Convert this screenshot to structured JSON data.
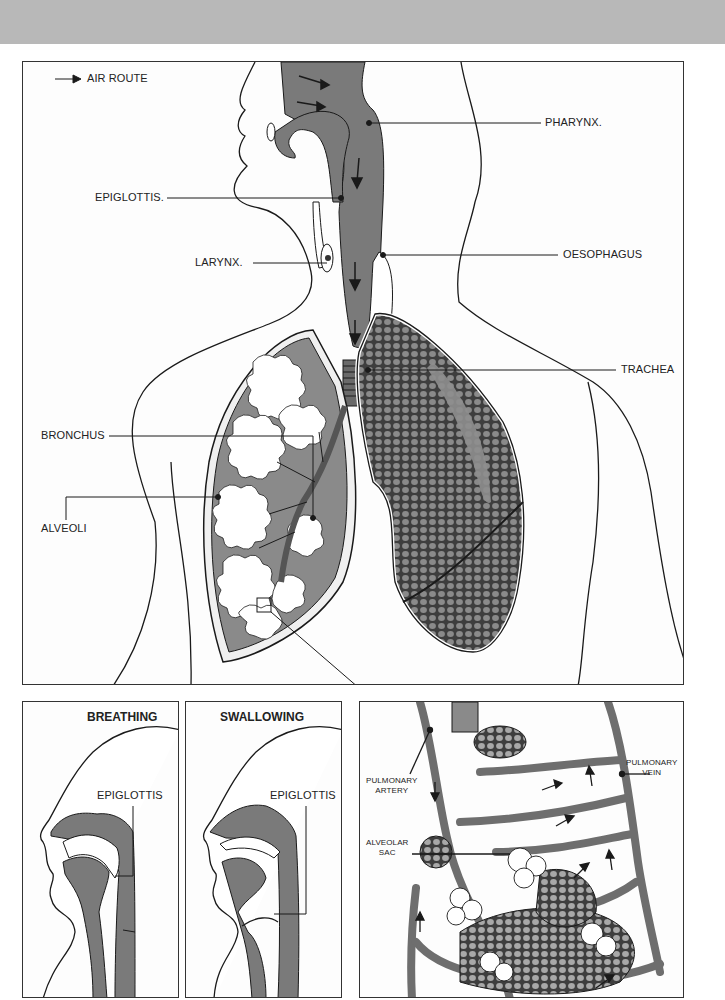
{
  "main_diagram": {
    "legend": {
      "icon": "arrow-right-icon",
      "label": "AIR ROUTE"
    },
    "labels": {
      "pharynx": "PHARYNX.",
      "epiglottis": "EPIGLOTTIS.",
      "larynx": "LARYNX.",
      "oesophagus": "OESOPHAGUS",
      "trachea": "TRACHEA",
      "bronchus": "BRONCHUS",
      "alveoli": "ALVEOLI"
    }
  },
  "breathing_panel": {
    "title": "BREATHING",
    "label": "EPIGLOTTIS"
  },
  "swallowing_panel": {
    "title": "SWALLOWING",
    "label": "EPIGLOTTIS"
  },
  "detail_panel": {
    "labels": {
      "pulmonary_artery_1": "PULMONARY",
      "pulmonary_artery_2": "ARTERY",
      "pulmonary_vein_1": "PULMONARY",
      "pulmonary_vein_2": "VEIN",
      "alveolar_sac_1": "ALVEOLAR",
      "alveolar_sac_2": "SAC"
    }
  },
  "colors": {
    "tissue": "#7a7a7a",
    "outline": "#1a1a1a",
    "banner": "#b8b8b8",
    "lung_dark": "#555555"
  }
}
